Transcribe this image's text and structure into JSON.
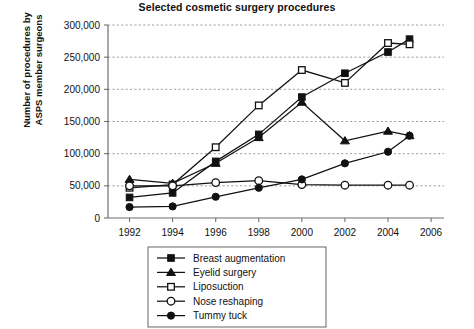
{
  "chart_data": {
    "type": "line",
    "title": "Selected cosmetic surgery procedures",
    "xlabel": "",
    "ylabel": "Number of procedures by\nASPS member surgeons",
    "x": [
      1992,
      1994,
      1996,
      1998,
      2000,
      2002,
      2004,
      2005
    ],
    "xlim": [
      1991,
      2006.6
    ],
    "ylim": [
      0,
      300000
    ],
    "xticks": [
      1992,
      1994,
      1996,
      1998,
      2000,
      2002,
      2004,
      2006
    ],
    "xtick_labels": [
      "1992",
      "1994",
      "1996",
      "1998",
      "2000",
      "2002",
      "2004",
      "2006"
    ],
    "yticks": [
      0,
      50000,
      100000,
      150000,
      200000,
      250000,
      300000
    ],
    "ytick_labels": [
      "0",
      "50,000",
      "100,000",
      "150,000",
      "200,000",
      "250,000",
      "300,000"
    ],
    "grid": true,
    "grid_axis": "y",
    "legend_position": "below-center",
    "series": [
      {
        "name": "Breast augmentation",
        "marker": "filled-square",
        "values": [
          32000,
          39000,
          88000,
          130000,
          188000,
          225000,
          258000,
          278000
        ]
      },
      {
        "name": "Eyelid surgery",
        "marker": "filled-triangle",
        "values": [
          60000,
          54000,
          85000,
          125000,
          180000,
          120000,
          135000,
          128000
        ]
      },
      {
        "name": "Liposuction",
        "marker": "open-square",
        "values": [
          47000,
          52000,
          110000,
          175000,
          230000,
          210000,
          272000,
          270000
        ]
      },
      {
        "name": "Nose reshaping",
        "marker": "open-circle",
        "values": [
          50000,
          50000,
          55000,
          58000,
          52000,
          51000,
          51000,
          51000
        ]
      },
      {
        "name": "Tummy tuck",
        "marker": "filled-circle",
        "values": [
          17000,
          18000,
          33000,
          47000,
          60000,
          85000,
          103000,
          128000
        ]
      }
    ]
  }
}
